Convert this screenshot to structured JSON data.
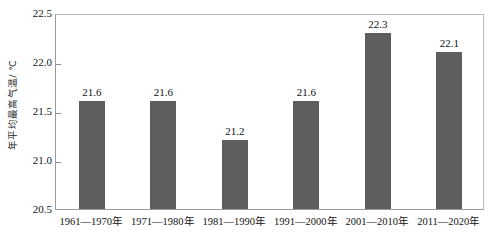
{
  "chart_data": {
    "type": "bar",
    "title": "",
    "subtitle": "",
    "xlabel": "",
    "ylabel": "年平均最高气温/ ℃",
    "categories": [
      "1961—1970年",
      "1971—1980年",
      "1981—1990年",
      "1991—2000年",
      "2001—2010年",
      "2011—2020年"
    ],
    "values": [
      21.6,
      21.6,
      21.2,
      21.6,
      22.3,
      22.1
    ],
    "data_labels": [
      "21.6",
      "21.6",
      "21.2",
      "21.6",
      "22.3",
      "22.1"
    ],
    "ylim": [
      20.5,
      22.5
    ],
    "yticks": [
      20.5,
      21.0,
      21.5,
      22.0,
      22.5
    ],
    "ytick_labels": [
      "20.5",
      "21.0",
      "21.5",
      "22.0",
      "22.5"
    ],
    "grid": false,
    "legend": null,
    "legend_position": "none",
    "series": [
      {
        "name": "年平均最高气温",
        "values": [
          21.6,
          21.6,
          21.2,
          21.6,
          22.3,
          22.1
        ],
        "color": "#5e5e5e"
      }
    ],
    "colors": {
      "bar_fill": "#5e5e5e",
      "axis_line": "#9a9a9a",
      "frame_line": "#b9b9b9",
      "text": "#111111",
      "background": "#ffffff"
    }
  }
}
